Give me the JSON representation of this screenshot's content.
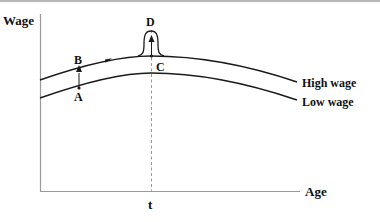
{
  "diagram": {
    "y_axis_label": "Wage",
    "x_axis_label": "Age",
    "time_marker_label": "t",
    "curves": [
      {
        "name": "High wage",
        "label": "High wage"
      },
      {
        "name": "Low wage",
        "label": "Low wage"
      }
    ],
    "points": {
      "A": "A",
      "B": "B",
      "C": "C",
      "D": "D"
    },
    "colors": {
      "curve": "#1a1a1a",
      "axis": "#9a9a9a",
      "dashed_line": "#9a9a9a",
      "text": "#111111"
    }
  }
}
